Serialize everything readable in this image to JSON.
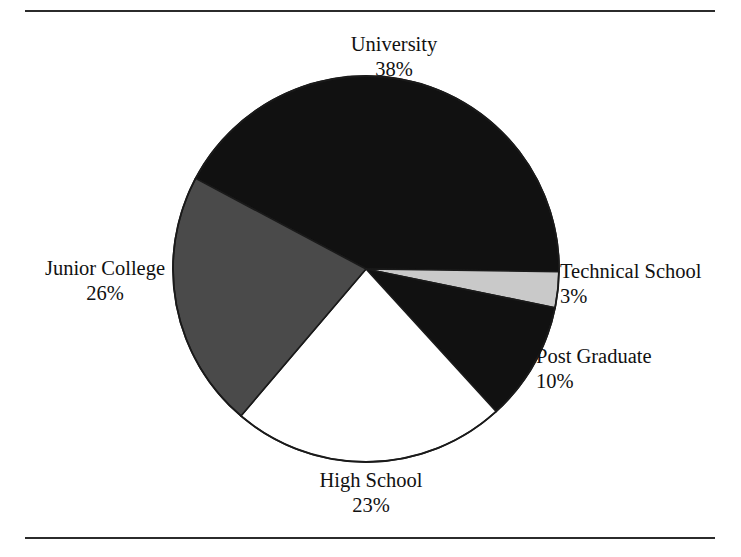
{
  "figure": {
    "clipped_header_text": "",
    "rules": {
      "top": "horizontal-rule",
      "bottom": "horizontal-rule"
    }
  },
  "chart_data": {
    "type": "pie",
    "title": "",
    "subtitle": "",
    "xlabel": "",
    "ylabel": "",
    "grid": false,
    "legend_position": "none",
    "labels_outside": true,
    "value_format": "percent",
    "total": 100,
    "categories": [
      "University",
      "Technical School",
      "Post Graduate",
      "High School",
      "Junior College"
    ],
    "values": [
      38,
      3,
      10,
      23,
      26
    ],
    "slices": [
      {
        "name": "University",
        "label": "University",
        "value": 38,
        "value_label": "38%",
        "color": "#111111",
        "color_name": "black",
        "start_angle_deg": 298,
        "end_angle_deg": 90.8
      },
      {
        "name": "Technical School",
        "label": "Technical School",
        "value": 3,
        "value_label": "3%",
        "color": "#c9c9c9",
        "color_name": "light-gray",
        "start_angle_deg": 90.8,
        "end_angle_deg": 101.6
      },
      {
        "name": "Post Graduate",
        "label": "Post Graduate",
        "value": 10,
        "value_label": "10%",
        "color": "#111111",
        "color_name": "black",
        "start_angle_deg": 101.6,
        "end_angle_deg": 137.6
      },
      {
        "name": "High School",
        "label": "High School",
        "value": 23,
        "value_label": "23%",
        "color": "#ffffff",
        "color_name": "white",
        "start_angle_deg": 137.6,
        "end_angle_deg": 220.4
      },
      {
        "name": "Junior College",
        "label": "Junior College",
        "value": 26,
        "value_label": "26%",
        "color": "#4a4a4a",
        "color_name": "dark-gray",
        "start_angle_deg": 220.4,
        "end_angle_deg": 298
      }
    ],
    "geometry": {
      "center_x": 366,
      "center_y": 269,
      "radius": 193
    },
    "colors": {
      "black": "#111111",
      "dark_gray": "#4a4a4a",
      "light_gray": "#c9c9c9",
      "white": "#ffffff",
      "outline": "#1a1a1a"
    }
  }
}
